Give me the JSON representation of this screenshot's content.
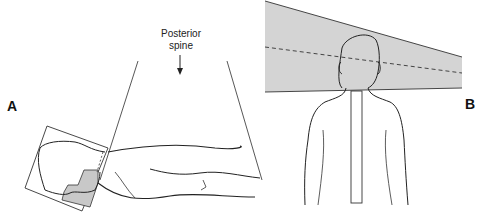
{
  "panels": [
    {
      "id": "A",
      "label": "A",
      "description": "Lateral view of patient lying prone with head in immobilization mask; diverging beam from posterior spine field"
    },
    {
      "id": "B",
      "label": "B",
      "description": "Posterior view of patient with shaded beam field across head and vertical spine field"
    }
  ],
  "annotations": {
    "posterior_spine_line1": "Posterior",
    "posterior_spine_line2": "spine"
  },
  "colors": {
    "line": "#222222",
    "field_shade": "#d4d4d4",
    "block_shade": "#c8c8c8"
  }
}
